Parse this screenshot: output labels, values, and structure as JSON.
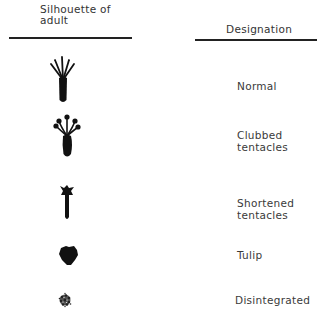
{
  "headers": {
    "silhouette_line1": "Silhouette of",
    "silhouette_line2": "adult",
    "designation": "Designation"
  },
  "rows": [
    {
      "silhouette": "normal-polyp-icon",
      "designation_line1": "Normal",
      "designation_line2": ""
    },
    {
      "silhouette": "clubbed-tentacles-polyp-icon",
      "designation_line1": "Clubbed",
      "designation_line2": "tentacles"
    },
    {
      "silhouette": "shortened-tentacles-polyp-icon",
      "designation_line1": "Shortened",
      "designation_line2": "tentacles"
    },
    {
      "silhouette": "tulip-polyp-icon",
      "designation_line1": "Tulip",
      "designation_line2": ""
    },
    {
      "silhouette": "disintegrated-polyp-icon",
      "designation_line1": "Disintegrated",
      "designation_line2": ""
    }
  ]
}
